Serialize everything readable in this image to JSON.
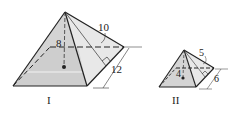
{
  "figure": {
    "pyramid_1": {
      "label": "I",
      "height_label": "8",
      "slant_height_label": "10",
      "base_edge_label": "12"
    },
    "pyramid_2": {
      "label": "II",
      "height_label": "4",
      "slant_height_label": "5",
      "base_edge_label": "6"
    },
    "colors": {
      "front_face": "#d4d4d4",
      "side_face": "#e6e6e6",
      "base_shade": "#c8c8c8",
      "line": "#222222"
    }
  }
}
